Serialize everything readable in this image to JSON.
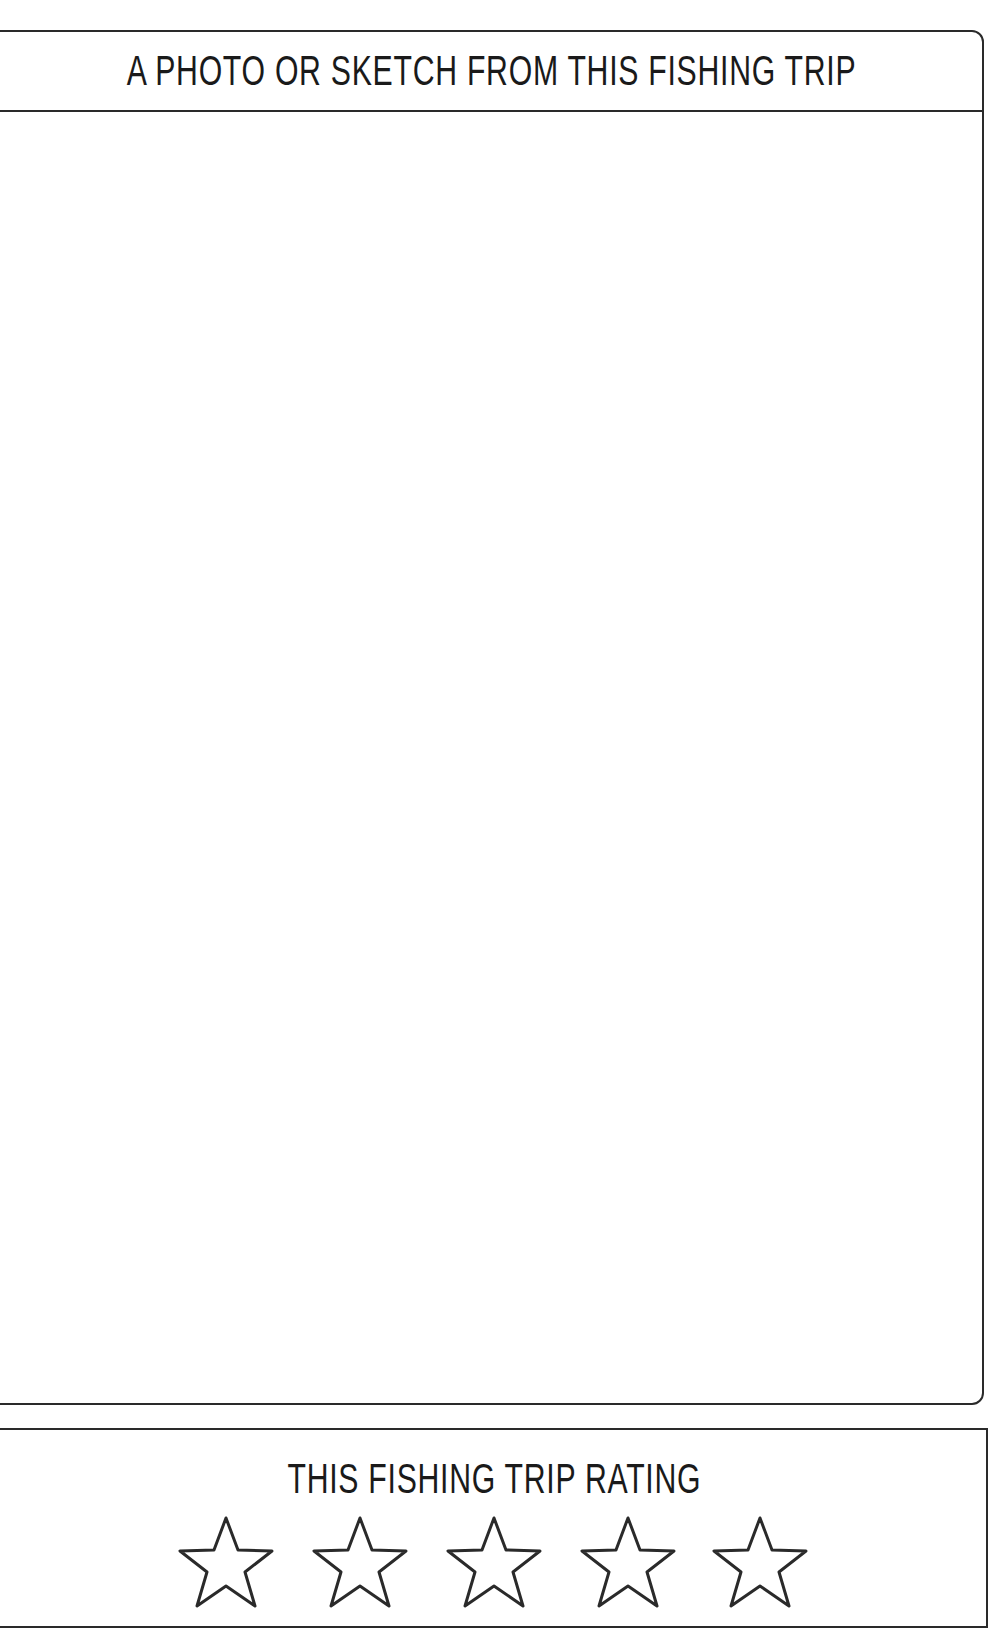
{
  "photo_section": {
    "title": "A PHOTO OR SKETCH FROM THIS FISHING TRIP",
    "content": ""
  },
  "rating_section": {
    "title": "THIS FISHING TRIP RATING",
    "stars": [
      {
        "index": 1,
        "icon": "star-outline-icon"
      },
      {
        "index": 2,
        "icon": "star-outline-icon"
      },
      {
        "index": 3,
        "icon": "star-outline-icon"
      },
      {
        "index": 4,
        "icon": "star-outline-icon"
      },
      {
        "index": 5,
        "icon": "star-outline-icon"
      }
    ],
    "max_rating": 5
  },
  "colors": {
    "ink": "#1a1a1a",
    "border": "#2a2a2a",
    "paper": "#ffffff"
  }
}
